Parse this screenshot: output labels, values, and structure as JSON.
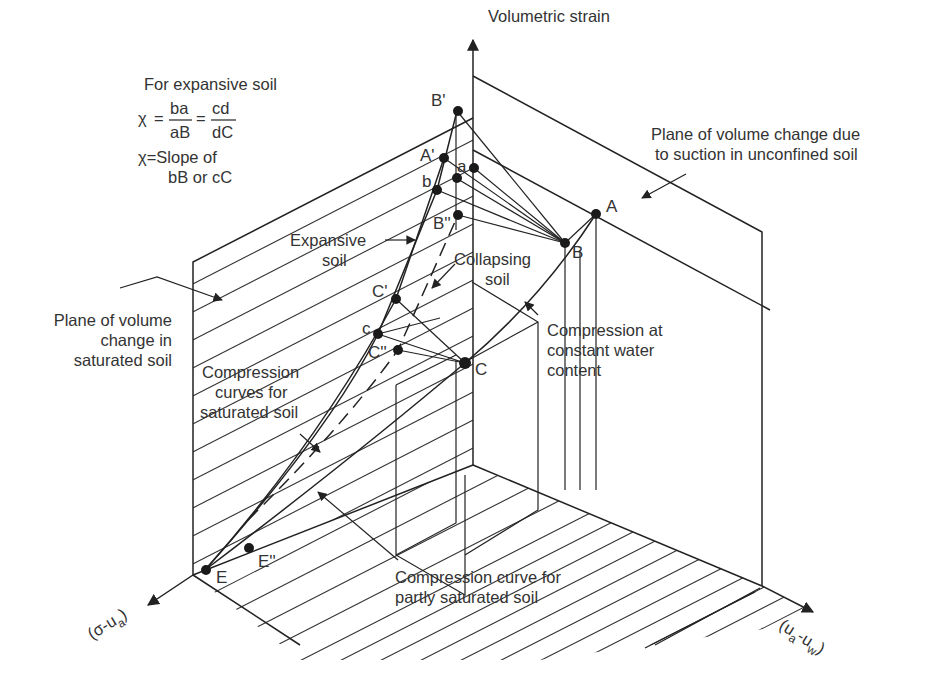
{
  "diagram": {
    "axes": {
      "vertical": "Volumetric strain",
      "left": "(σ-u",
      "left_sub": "a",
      "left_close": ")",
      "right": "(u",
      "right_sub1": "a",
      "right_mid": "-u",
      "right_sub2": "w",
      "right_close": ")"
    },
    "formula": {
      "heading": "For expansive soil",
      "chi": "χ",
      "eq": "=",
      "num1": "ba",
      "den1": "aB",
      "num2": "cd",
      "den2": "dC",
      "slope_line1": "χ=Slope of",
      "slope_line2": "bB or cC"
    },
    "annotations": {
      "suction_plane_1": "Plane of volume change due",
      "suction_plane_2": "to suction in unconfined soil",
      "saturated_plane_1": "Plane of volume",
      "saturated_plane_2": "change in",
      "saturated_plane_3": "saturated soil",
      "expansive_1": "Expansive",
      "expansive_2": "soil",
      "collapsing_1": "Collapsing",
      "collapsing_2": "soil",
      "const_water_1": "Compression at",
      "const_water_2": "constant water",
      "const_water_3": "content",
      "sat_curves_1": "Compression",
      "sat_curves_2": "curves for",
      "sat_curves_3": "saturated soil",
      "partly_sat_1": "Compression curve for",
      "partly_sat_2": "partly saturated soil"
    },
    "points": {
      "B_prime": "B'",
      "A_prime": "A'",
      "a": "a",
      "b": "b",
      "B_dprime": "B''",
      "A": "A",
      "B": "B",
      "C_prime": "C'",
      "c": "c",
      "C_dprime": "C''",
      "C": "C",
      "E": "E",
      "E_dprime": "E''"
    },
    "colors": {
      "line": "#222222",
      "text": "#333333",
      "background": "#ffffff"
    }
  }
}
